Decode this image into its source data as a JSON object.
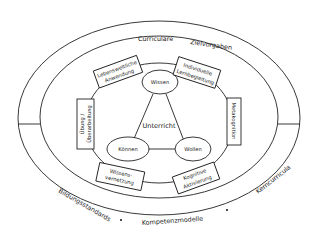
{
  "outer_ring": {
    "top_left": "Curriculare",
    "top_right": "Zielvorgaben",
    "bottom_left": "Bildungsstandards",
    "bottom_center": "Kompetenzmodelle",
    "bottom_right": "Kerncurricula"
  },
  "center": {
    "label": "Unterricht",
    "nodes": {
      "top": "Wissen",
      "left": "Können",
      "right": "Wollen"
    }
  },
  "boxes": {
    "top_left": {
      "line1": "Lebensweltliche",
      "line2": "Anwendung"
    },
    "top_right": {
      "line1": "Individuelle",
      "line2": "Lernbegleitung"
    },
    "left": {
      "line1": "Übung /",
      "line2": "Überarbeitung"
    },
    "right": {
      "line1": "Metakognition"
    },
    "bottom_left": {
      "line1": "Wissens-",
      "line2": "vernetzung"
    },
    "bottom_right": {
      "line1": "Kognitive",
      "line2": "Aktivierung"
    }
  },
  "colors": {
    "stroke": "#222222",
    "background": "#ffffff",
    "text": "#222222"
  }
}
